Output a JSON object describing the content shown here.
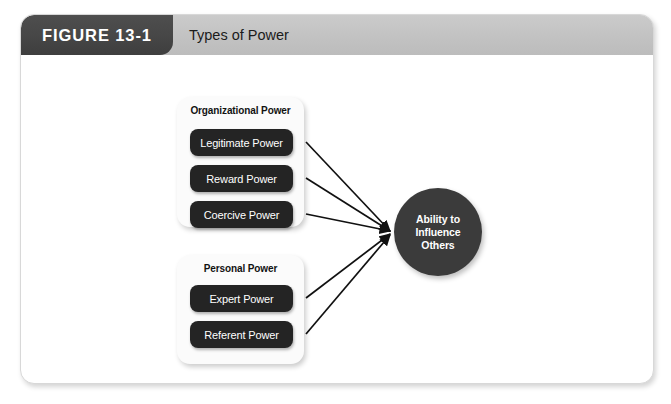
{
  "figure": {
    "tab_label": "FIGURE 13-1",
    "title": "Types of Power"
  },
  "diagram": {
    "groups": [
      {
        "id": "organizational",
        "heading": "Organizational Power",
        "boxes": [
          {
            "id": "legitimate",
            "label": "Legitimate Power"
          },
          {
            "id": "reward",
            "label": "Reward Power"
          },
          {
            "id": "coercive",
            "label": "Coercive Power"
          }
        ]
      },
      {
        "id": "personal",
        "heading": "Personal Power",
        "boxes": [
          {
            "id": "expert",
            "label": "Expert Power"
          },
          {
            "id": "referent",
            "label": "Referent Power"
          }
        ]
      }
    ],
    "outcome": {
      "label": "Ability to\nInfluence\nOthers"
    },
    "connectors": {
      "count": 5,
      "description": "arrows from each power box converging on the outcome circle",
      "target_x": 371,
      "target_y": 177,
      "sources": [
        {
          "from": "legitimate",
          "x": 285,
          "y": 87
        },
        {
          "from": "reward",
          "x": 285,
          "y": 123
        },
        {
          "from": "coercive",
          "x": 285,
          "y": 159
        },
        {
          "from": "expert",
          "x": 285,
          "y": 243
        },
        {
          "from": "referent",
          "x": 285,
          "y": 279
        }
      ]
    }
  },
  "colors": {
    "card_background": "#ffffff",
    "card_border": "#d8d8d8",
    "header_gray": "#c4c4c4",
    "tab_dark": "#474747",
    "box_dark": "#242424",
    "circle_dark": "#3b3b3b",
    "panel_white": "#fbfbfb",
    "connector": "#111111",
    "text_light": "#ffffff",
    "text_dark": "#121212"
  }
}
